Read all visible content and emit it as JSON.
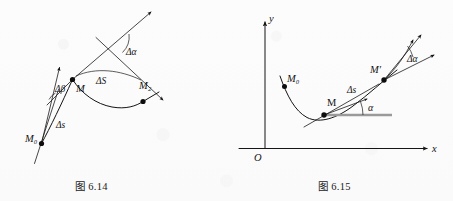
{
  "page": {
    "background_color": "#fdfdfd",
    "ink_color": "#141414",
    "gray_accent": "#9a9a9a",
    "width": 453,
    "height": 201
  },
  "figures": [
    {
      "id": "fig-6-14",
      "caption": "图 6.14",
      "description": "Arc MM2 on a curve with tangent lines at M0, M and M2 showing turning angles",
      "labels": {
        "point_m0": "M₀",
        "point_m": "M",
        "point_m2": "M₂",
        "delta_beta": "Δβ",
        "delta_s_lower": "Δs",
        "delta_s_upper": "ΔS",
        "delta_alpha": "Δα"
      }
    },
    {
      "id": "fig-6-15",
      "caption": "图 6.15",
      "description": "Curve y=f(x) in xOy axes with tangent at M making angle alpha and tangent at M' making angle alpha plus delta alpha",
      "labels": {
        "axis_y": "y",
        "axis_x": "x",
        "origin": "O",
        "point_m0": "M₀",
        "point_m": "M",
        "point_m_prime": "M′",
        "delta_s": "Δs",
        "alpha": "α",
        "delta_alpha": "Δα"
      }
    }
  ]
}
